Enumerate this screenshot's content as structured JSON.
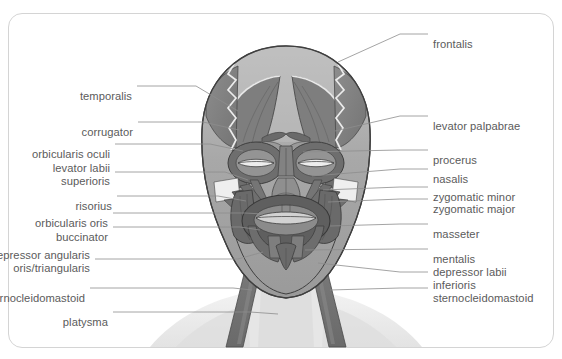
{
  "figure": {
    "frame_color": "#d4d4d4",
    "background_color": "#ffffff",
    "label_color": "#5b5b5b",
    "leader_color": "#8d8d8d",
    "caption": "",
    "view": "anterior"
  },
  "illustration": {
    "name": "human-head-facial-muscles-anterior",
    "palette": {
      "skin_light": "#e9e9e9",
      "muscle_mid": "#8b8b8b",
      "muscle_dark": "#6f6f6f",
      "muscle_darker": "#5e5e5e",
      "skull_light": "#b4b4b4",
      "skull_mid": "#a0a0a0",
      "tendon_pale": "#e4e4e4",
      "shoulder_shade": "#e6e6e6",
      "outline": "#3c3c3c",
      "lip_light": "#cfcfcf"
    }
  },
  "labels_left": [
    {
      "id": "temporalis",
      "text": "temporalis",
      "x": 132,
      "y": 90,
      "leader": [
        [
          137,
          86
        ],
        [
          196,
          86
        ],
        [
          238,
          111
        ]
      ]
    },
    {
      "id": "corrugator",
      "text": "corrugator",
      "x": 133,
      "y": 126,
      "leader": [
        [
          138,
          122
        ],
        [
          203,
          122
        ],
        [
          239,
          130
        ]
      ]
    },
    {
      "id": "orbicularis-oculi",
      "text": "orbicularis oculi",
      "x": 110,
      "y": 148,
      "leader": [
        [
          115,
          144
        ],
        [
          210,
          144
        ],
        [
          243,
          151
        ]
      ]
    },
    {
      "id": "levator-labii-superioris",
      "text": "levator labii",
      "text2": "superioris",
      "x": 110,
      "y": 162,
      "leader": [
        [
          115,
          172
        ],
        [
          225,
          172
        ],
        [
          248,
          180
        ]
      ]
    },
    {
      "id": "risorius",
      "text": "risorius",
      "x": 112,
      "y": 200,
      "leader": [
        [
          117,
          196
        ],
        [
          218,
          196
        ],
        [
          246,
          201
        ]
      ]
    },
    {
      "id": "orbicularis-oris",
      "text": "orbicularis oris",
      "x": 108,
      "y": 217,
      "leader": [
        [
          113,
          213
        ],
        [
          245,
          213
        ],
        [
          263,
          214
        ]
      ]
    },
    {
      "id": "buccinator",
      "text": "buccinator",
      "x": 108,
      "y": 231,
      "leader": [
        [
          113,
          227
        ],
        [
          240,
          227
        ],
        [
          260,
          230
        ]
      ]
    },
    {
      "id": "depressor-anguli-oris",
      "text": "depressor angularis",
      "text2": "oris/triangularis",
      "x": 90,
      "y": 249,
      "leader": [
        [
          95,
          259
        ],
        [
          238,
          259
        ],
        [
          263,
          252
        ]
      ]
    },
    {
      "id": "sternocleidomastoid-left",
      "text": "sternocleidomastoid",
      "x": 85,
      "y": 292,
      "leader": [
        [
          90,
          288
        ],
        [
          233,
          288
        ],
        [
          252,
          290
        ]
      ]
    },
    {
      "id": "platysma",
      "text": "platysma",
      "x": 108,
      "y": 316,
      "leader": [
        [
          113,
          312
        ],
        [
          250,
          312
        ],
        [
          278,
          314
        ]
      ]
    }
  ],
  "labels_right": [
    {
      "id": "frontalis",
      "text": "frontalis",
      "x": 433,
      "y": 38,
      "leader": [
        [
          428,
          34
        ],
        [
          400,
          34
        ],
        [
          338,
          62
        ]
      ]
    },
    {
      "id": "levator-palpabrae",
      "text": "levator palpabrae",
      "x": 433,
      "y": 120,
      "leader": [
        [
          428,
          116
        ],
        [
          400,
          116
        ],
        [
          335,
          131
        ]
      ]
    },
    {
      "id": "procerus",
      "text": "procerus",
      "x": 433,
      "y": 154,
      "leader": [
        [
          428,
          150
        ],
        [
          400,
          150
        ],
        [
          303,
          152
        ]
      ]
    },
    {
      "id": "nasalis",
      "text": "nasalis",
      "x": 433,
      "y": 173,
      "leader": [
        [
          428,
          169
        ],
        [
          400,
          169
        ],
        [
          312,
          176
        ]
      ]
    },
    {
      "id": "zygomatic-minor",
      "text": "zygomatic minor",
      "x": 433,
      "y": 191,
      "leader": [
        [
          428,
          187
        ],
        [
          400,
          187
        ],
        [
          323,
          190
        ]
      ]
    },
    {
      "id": "zygomatic-major",
      "text": "zygomatic major",
      "x": 433,
      "y": 203,
      "leader": [
        [
          428,
          199
        ],
        [
          400,
          199
        ],
        [
          328,
          202
        ]
      ]
    },
    {
      "id": "masseter",
      "text": "masseter",
      "x": 433,
      "y": 228,
      "leader": [
        [
          428,
          224
        ],
        [
          400,
          224
        ],
        [
          330,
          226
        ]
      ]
    },
    {
      "id": "mentalis",
      "text": "mentalis",
      "x": 433,
      "y": 253,
      "leader": [
        [
          428,
          249
        ],
        [
          400,
          249
        ],
        [
          305,
          250
        ]
      ]
    },
    {
      "id": "depressor-labii-inferioris",
      "text": "depressor labii",
      "text2": "inferioris",
      "x": 433,
      "y": 266,
      "leader": [
        [
          428,
          272
        ],
        [
          400,
          272
        ],
        [
          318,
          263
        ]
      ]
    },
    {
      "id": "sternocleidomastoid-right",
      "text": "sternocleidomastoid",
      "x": 433,
      "y": 292,
      "leader": [
        [
          428,
          288
        ],
        [
          400,
          288
        ],
        [
          330,
          290
        ]
      ]
    }
  ]
}
